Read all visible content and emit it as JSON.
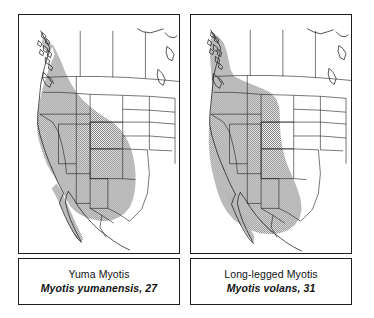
{
  "figure": {
    "type": "species-range-map-pair",
    "background_color": "#ffffff",
    "line_color": "#1c1c1c",
    "range_fill_color": "#9a9a9a",
    "range_fill_style": "stipple-halftone"
  },
  "panels": [
    {
      "id": "yuma-myotis",
      "common_name": "Yuma Myotis",
      "scientific_name": "Myotis yumanensis, 27",
      "map_number": "27",
      "range_description": "Shaded range covers coastal British Columbia, Washington, Oregon, California, Nevada, Idaho, Utah, Arizona, New Mexico, western Colorado, western Texas and northwestern Mexico including Baja California"
    },
    {
      "id": "long-legged-myotis",
      "common_name": "Long-legged Myotis",
      "scientific_name": "Myotis volans, 31",
      "map_number": "31",
      "range_description": "Shaded range covers southern Alaska panhandle, British Columbia, Alberta, Washington, Oregon, California, Idaho, Montana, Wyoming, Nevada, Utah, Colorado, Arizona, New Mexico, western Texas and northern Mexico"
    }
  ]
}
